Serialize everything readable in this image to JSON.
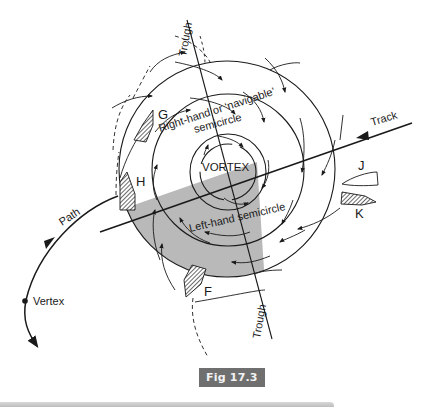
{
  "figure": {
    "caption": "Fig 17.3",
    "labels": {
      "trough_top": "Trough",
      "trough_bottom": "Trough",
      "track": "Track",
      "path": "Path",
      "vertex": "Vertex",
      "vortex": "VORTEX",
      "right_semicircle_line1": "Right-hand or ‘navigable’",
      "right_semicircle_line2": "semicircle",
      "left_semicircle": "Left-hand semicircle"
    },
    "vessels": [
      {
        "id": "G",
        "style": "hatched"
      },
      {
        "id": "H",
        "style": "hatched"
      },
      {
        "id": "F",
        "style": "hatched"
      },
      {
        "id": "J",
        "style": "outline"
      },
      {
        "id": "K",
        "style": "hatched"
      }
    ],
    "colors": {
      "line": "#1a1a1a",
      "shaded_quadrant": "#b9b9b9",
      "caption_bg": "#6f6f6f",
      "caption_text": "#f2f2f2"
    }
  }
}
